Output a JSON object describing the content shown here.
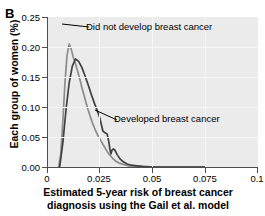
{
  "panel": {
    "label": "B"
  },
  "axes": {
    "ylabel": "Each group of women (%)",
    "xlabel_line1": "Estimated 5-year risk of breast cancer",
    "xlabel_line2": "diagnosis using the Gail et al. model",
    "yticks": [
      "0.25",
      "0.20",
      "0.15",
      "0.10",
      "0.05",
      "0.00"
    ],
    "xticks": [
      "0",
      "0.025",
      "0.05",
      "0.075",
      "0.1"
    ]
  },
  "annotations": {
    "did_not_develop": "Did not develop breast cancer",
    "developed": "Developed breast cancer"
  },
  "colors": {
    "series_did_not_develop": "#8c8c8c",
    "series_developed": "#404040",
    "plot_background": "#ebebeb",
    "gridline": "#f7f7f7",
    "axis": "#4d4d4d"
  },
  "chart_data": {
    "type": "line",
    "title": "",
    "xlabel": "Estimated 5-year risk of breast cancer diagnosis using the Gail et al. model",
    "ylabel": "Each group of women (%)",
    "xlim": [
      0,
      0.1
    ],
    "ylim": [
      0.0,
      0.25
    ],
    "grid": true,
    "legend": "annotations-inline",
    "series": [
      {
        "name": "Did not develop breast cancer",
        "color": "#8c8c8c",
        "peak_x": 0.0105,
        "peak_y": 0.205,
        "points": [
          [
            0.0055,
            0.0
          ],
          [
            0.0065,
            0.02
          ],
          [
            0.0075,
            0.075
          ],
          [
            0.0085,
            0.14
          ],
          [
            0.0095,
            0.186
          ],
          [
            0.0105,
            0.205
          ],
          [
            0.0115,
            0.196
          ],
          [
            0.0125,
            0.182
          ],
          [
            0.0135,
            0.172
          ],
          [
            0.0145,
            0.16
          ],
          [
            0.0155,
            0.147
          ],
          [
            0.0165,
            0.133
          ],
          [
            0.0175,
            0.12
          ],
          [
            0.0185,
            0.107
          ],
          [
            0.0195,
            0.095
          ],
          [
            0.0205,
            0.084
          ],
          [
            0.0215,
            0.074
          ],
          [
            0.0225,
            0.065
          ],
          [
            0.0235,
            0.057
          ],
          [
            0.0245,
            0.05
          ],
          [
            0.0255,
            0.044
          ],
          [
            0.0265,
            0.038
          ],
          [
            0.0275,
            0.032
          ],
          [
            0.0285,
            0.026
          ],
          [
            0.0295,
            0.021
          ],
          [
            0.0305,
            0.017
          ],
          [
            0.0315,
            0.013
          ],
          [
            0.0325,
            0.01
          ],
          [
            0.0345,
            0.006
          ],
          [
            0.0365,
            0.004
          ],
          [
            0.0385,
            0.002
          ],
          [
            0.0405,
            0.001
          ],
          [
            0.0425,
            0.001
          ],
          [
            0.046,
            0.0
          ],
          [
            0.075,
            0.0
          ]
        ]
      },
      {
        "name": "Developed breast cancer",
        "color": "#404040",
        "peak_x": 0.0135,
        "peak_y": 0.18,
        "points": [
          [
            0.006,
            0.0
          ],
          [
            0.0075,
            0.04
          ],
          [
            0.009,
            0.095
          ],
          [
            0.0105,
            0.14
          ],
          [
            0.012,
            0.168
          ],
          [
            0.0135,
            0.18
          ],
          [
            0.015,
            0.176
          ],
          [
            0.0165,
            0.166
          ],
          [
            0.018,
            0.152
          ],
          [
            0.0195,
            0.137
          ],
          [
            0.021,
            0.121
          ],
          [
            0.0225,
            0.106
          ],
          [
            0.024,
            0.092
          ],
          [
            0.025,
            0.082
          ],
          [
            0.0258,
            0.07
          ],
          [
            0.0265,
            0.06
          ],
          [
            0.0275,
            0.057
          ],
          [
            0.0285,
            0.055
          ],
          [
            0.0292,
            0.044
          ],
          [
            0.0298,
            0.03
          ],
          [
            0.0303,
            0.022
          ],
          [
            0.0308,
            0.028
          ],
          [
            0.0315,
            0.03
          ],
          [
            0.0322,
            0.028
          ],
          [
            0.0332,
            0.021
          ],
          [
            0.0345,
            0.014
          ],
          [
            0.036,
            0.009
          ],
          [
            0.038,
            0.005
          ],
          [
            0.04,
            0.003
          ],
          [
            0.0425,
            0.002
          ],
          [
            0.0455,
            0.001
          ],
          [
            0.05,
            0.0
          ],
          [
            0.075,
            0.0
          ]
        ]
      }
    ]
  }
}
